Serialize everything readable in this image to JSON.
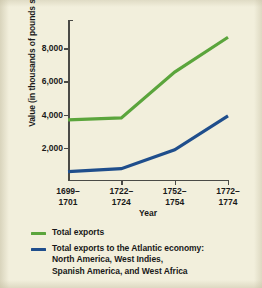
{
  "chart_data": {
    "type": "line",
    "title": "",
    "xlabel": "Year",
    "ylabel": "Value (in thousands of pounds sterling)",
    "categories": [
      "1699–1701",
      "1722–1724",
      "1752–1754",
      "1772–1774"
    ],
    "category_lines": [
      [
        "1699–",
        "1701"
      ],
      [
        "1722–",
        "1724"
      ],
      [
        "1752–",
        "1754"
      ],
      [
        "1772–",
        "1774"
      ]
    ],
    "ylim": [
      0,
      9700
    ],
    "yticks": [
      2000,
      4000,
      6000,
      8000
    ],
    "ytick_labels": [
      "2,000",
      "4,000",
      "6,000",
      "8,000"
    ],
    "grid": false,
    "legend_position": "below",
    "series": [
      {
        "name": "Total exports",
        "color": "#5ba53c",
        "values": [
          3680,
          3800,
          6560,
          8660
        ],
        "legend_lines": [
          "Total exports"
        ]
      },
      {
        "name": "Total exports to the Atlantic economy: North America, West Indies, Spanish America, and West Africa",
        "color": "#1f4e8c",
        "values": [
          560,
          740,
          1880,
          3920
        ],
        "legend_lines": [
          "Total exports to the Atlantic economy:",
          "North America, West Indies,",
          "Spanish America, and West Africa"
        ]
      }
    ]
  },
  "colors": {
    "background": "#f2efdc",
    "page": "#e9e6d2",
    "axis": "#4a4a46",
    "text": "#191919",
    "green": "#5ba53c",
    "blue": "#1f4e8c"
  }
}
